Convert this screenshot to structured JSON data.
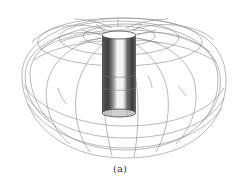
{
  "figure": {
    "caption": "(a)",
    "colors": {
      "mesh": "#8a8a8a",
      "cylinder_dark": "#4a4a4a",
      "cylinder_light": "#f4f4f4",
      "background": "#ffffff"
    }
  }
}
